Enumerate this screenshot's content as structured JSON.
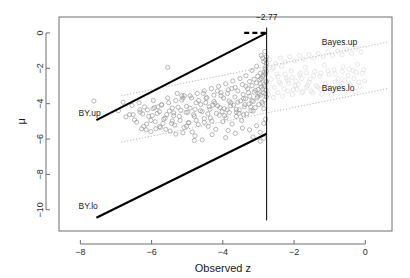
{
  "chart_data": {
    "type": "scatter",
    "title": "",
    "xlabel": "Observed z",
    "ylabel": "μ",
    "xlim": [
      -8.6,
      0.75
    ],
    "ylim": [
      -11.2,
      0.9
    ],
    "xticks": [
      -8,
      -6,
      -4,
      -2,
      0
    ],
    "xticklabels": [
      "−8",
      "−6",
      "−4",
      "−2",
      "0"
    ],
    "yticks": [
      0,
      -2,
      -4,
      -6,
      -8,
      -10
    ],
    "yticklabels": [
      "0",
      "−2",
      "−4",
      "−6",
      "−8",
      "−10"
    ],
    "grid": false,
    "legend_position": "inline-annotations",
    "annotations": [
      {
        "text": "−2.77",
        "x": -2.77,
        "y": 0.72,
        "name": "cutoff-label"
      },
      {
        "text": "BY.up",
        "x": -8.05,
        "y": -4.72,
        "name": "by-up-label"
      },
      {
        "text": "BY.lo",
        "x": -8.05,
        "y": -9.93,
        "name": "by-lo-label"
      },
      {
        "text": "Bayes.up",
        "x": -1.22,
        "y": -0.68,
        "name": "bayes-up-label"
      },
      {
        "text": "Bayes.lo",
        "x": -1.22,
        "y": -3.3,
        "name": "bayes-lo-label"
      }
    ],
    "vline": {
      "x": -2.77,
      "y_from": 0.3,
      "y_to": -10.6,
      "color": "#000000",
      "width": 1
    },
    "series": [
      {
        "name": "BY.up",
        "type": "line",
        "style": "solid",
        "color": "#000000",
        "width": 2.1,
        "points": [
          [
            -7.55,
            -4.93
          ],
          [
            -2.77,
            0.0
          ]
        ]
      },
      {
        "name": "BY.up.flat",
        "type": "line",
        "style": "dashed",
        "color": "#000000",
        "width": 2.4,
        "points": [
          [
            -3.4,
            0.0
          ],
          [
            -2.77,
            0.0
          ]
        ]
      },
      {
        "name": "BY.lo",
        "type": "line",
        "style": "solid",
        "color": "#000000",
        "width": 2.1,
        "points": [
          [
            -7.55,
            -10.45
          ],
          [
            -2.77,
            -5.7
          ]
        ]
      },
      {
        "name": "Bayes.up",
        "type": "line",
        "style": "dotted",
        "color": "#b9b9b9",
        "width": 1,
        "points": [
          [
            -6.85,
            -3.55
          ],
          [
            0.62,
            -0.52
          ]
        ]
      },
      {
        "name": "Bayes.lo",
        "type": "line",
        "style": "dotted",
        "color": "#b9b9b9",
        "width": 1,
        "points": [
          [
            -6.85,
            -6.18
          ],
          [
            0.62,
            -3.15
          ]
        ]
      }
    ],
    "point_style": {
      "marker": "open-circle",
      "radius": 2.1,
      "color_main": "#9a9a9a",
      "color_faint": "#dcdcdc",
      "linewidth": 0.7
    },
    "points_main": [
      [
        -7.62,
        -3.85
      ],
      [
        -6.93,
        -4.4
      ],
      [
        -6.8,
        -3.92
      ],
      [
        -6.62,
        -4.62
      ],
      [
        -6.55,
        -4.1
      ],
      [
        -6.42,
        -5.05
      ],
      [
        -6.33,
        -4.35
      ],
      [
        -6.28,
        -5.42
      ],
      [
        -6.2,
        -4.18
      ],
      [
        -6.14,
        -5.15
      ],
      [
        -6.08,
        -4.72
      ],
      [
        -6.02,
        -5.58
      ],
      [
        -5.96,
        -4.28
      ],
      [
        -5.9,
        -5.02
      ],
      [
        -5.84,
        -4.55
      ],
      [
        -5.78,
        -5.3
      ],
      [
        -5.72,
        -4.05
      ],
      [
        -5.66,
        -4.88
      ],
      [
        -5.6,
        -5.45
      ],
      [
        -5.55,
        -1.95
      ],
      [
        -5.5,
        -4.42
      ],
      [
        -5.44,
        -5.12
      ],
      [
        -5.38,
        -4.68
      ],
      [
        -5.32,
        -5.72
      ],
      [
        -5.26,
        -4.2
      ],
      [
        -5.2,
        -4.95
      ],
      [
        -5.15,
        -3.8
      ],
      [
        -5.09,
        -5.35
      ],
      [
        -5.03,
        -4.5
      ],
      [
        -4.97,
        -5.08
      ],
      [
        -4.92,
        -4.25
      ],
      [
        -4.86,
        -5.6
      ],
      [
        -4.8,
        -4.72
      ],
      [
        -4.75,
        -3.95
      ],
      [
        -4.69,
        -5.18
      ],
      [
        -4.63,
        -4.4
      ],
      [
        -4.58,
        -6.05
      ],
      [
        -4.52,
        -4.85
      ],
      [
        -4.47,
        -3.7
      ],
      [
        -4.41,
        -5.28
      ],
      [
        -4.36,
        -4.32
      ],
      [
        -4.31,
        -4.98
      ],
      [
        -4.25,
        -3.88
      ],
      [
        -4.2,
        -5.45
      ],
      [
        -4.15,
        -4.12
      ],
      [
        -4.1,
        -4.65
      ],
      [
        -4.05,
        -3.55
      ],
      [
        -4.0,
        -5.02
      ],
      [
        -3.96,
        -4.28
      ],
      [
        -3.91,
        -4.8
      ],
      [
        -3.87,
        -3.42
      ],
      [
        -3.82,
        -4.5
      ],
      [
        -3.78,
        -3.95
      ],
      [
        -3.74,
        -5.15
      ],
      [
        -3.7,
        -4.08
      ],
      [
        -3.66,
        -3.62
      ],
      [
        -3.62,
        -4.72
      ],
      [
        -3.58,
        -3.28
      ],
      [
        -3.54,
        -4.35
      ],
      [
        -3.5,
        -3.85
      ],
      [
        -3.47,
        -4.95
      ],
      [
        -3.43,
        -3.48
      ],
      [
        -3.4,
        -4.18
      ],
      [
        -3.36,
        -3.72
      ],
      [
        -3.33,
        -4.58
      ],
      [
        -3.3,
        -3.15
      ],
      [
        -3.27,
        -4.02
      ],
      [
        -3.24,
        -3.58
      ],
      [
        -3.21,
        -4.4
      ],
      [
        -3.18,
        -2.98
      ],
      [
        -3.15,
        -3.88
      ],
      [
        -3.12,
        -3.35
      ],
      [
        -3.09,
        -4.22
      ],
      [
        -3.06,
        -2.82
      ],
      [
        -3.04,
        -3.68
      ],
      [
        -3.01,
        -3.2
      ],
      [
        -2.99,
        -4.05
      ],
      [
        -2.96,
        -2.65
      ],
      [
        -2.94,
        -3.52
      ],
      [
        -2.92,
        -3.05
      ],
      [
        -2.9,
        -3.92
      ],
      [
        -2.88,
        -2.48
      ],
      [
        -2.86,
        -3.38
      ],
      [
        -2.84,
        -2.92
      ],
      [
        -2.82,
        -3.78
      ],
      [
        -2.8,
        -2.32
      ],
      [
        -2.79,
        -3.22
      ],
      [
        -2.78,
        -2.78
      ],
      [
        -2.78,
        -3.62
      ],
      [
        -2.78,
        -2.15
      ],
      [
        -6.48,
        -4.92
      ],
      [
        -6.25,
        -4.58
      ],
      [
        -6.02,
        -4.95
      ],
      [
        -5.82,
        -4.18
      ],
      [
        -5.62,
        -4.82
      ],
      [
        -5.42,
        -4.25
      ],
      [
        -5.22,
        -4.72
      ],
      [
        -5.02,
        -4.15
      ],
      [
        -4.82,
        -4.62
      ],
      [
        -4.62,
        -4.05
      ],
      [
        -4.42,
        -4.58
      ],
      [
        -4.22,
        -3.98
      ],
      [
        -4.02,
        -4.45
      ],
      [
        -3.82,
        -3.85
      ],
      [
        -3.62,
        -4.32
      ],
      [
        -3.42,
        -3.72
      ],
      [
        -3.22,
        -4.18
      ],
      [
        -3.02,
        -3.58
      ],
      [
        -2.88,
        -4.02
      ],
      [
        -2.8,
        -3.45
      ],
      [
        -6.35,
        -3.95
      ],
      [
        -6.15,
        -5.48
      ],
      [
        -5.95,
        -3.82
      ],
      [
        -5.75,
        -5.35
      ],
      [
        -5.55,
        -3.68
      ],
      [
        -5.35,
        -5.22
      ],
      [
        -5.15,
        -3.55
      ],
      [
        -4.95,
        -5.08
      ],
      [
        -4.75,
        -4.95
      ],
      [
        -4.55,
        -3.42
      ],
      [
        -4.35,
        -4.82
      ],
      [
        -4.15,
        -3.28
      ],
      [
        -3.95,
        -4.68
      ],
      [
        -3.75,
        -3.15
      ],
      [
        -3.55,
        -4.55
      ],
      [
        -3.35,
        -3.02
      ],
      [
        -3.15,
        -4.42
      ],
      [
        -2.95,
        -2.88
      ],
      [
        -2.85,
        -4.28
      ],
      [
        -2.79,
        -2.72
      ],
      [
        -4.8,
        -6.08
      ],
      [
        -4.3,
        -5.75
      ],
      [
        -3.85,
        -5.52
      ],
      [
        -3.45,
        -5.38
      ],
      [
        -3.05,
        -5.25
      ],
      [
        -2.85,
        -5.12
      ],
      [
        -2.8,
        -4.88
      ],
      [
        -2.95,
        -5.62
      ],
      [
        -3.25,
        -5.48
      ],
      [
        -3.65,
        -5.68
      ],
      [
        -2.92,
        -1.28
      ],
      [
        -2.85,
        -1.62
      ],
      [
        -2.88,
        -1.42
      ],
      [
        -3.05,
        -1.88
      ],
      [
        -2.82,
        -1.05
      ],
      [
        -3.18,
        -2.12
      ],
      [
        -2.95,
        -2.28
      ],
      [
        -3.35,
        -2.42
      ],
      [
        -2.78,
        -1.72
      ],
      [
        -2.8,
        -1.52
      ],
      [
        -3.52,
        -2.58
      ],
      [
        -3.72,
        -2.72
      ],
      [
        -3.92,
        -2.88
      ],
      [
        -4.12,
        -3.02
      ],
      [
        -4.32,
        -3.15
      ],
      [
        -4.52,
        -3.28
      ],
      [
        -4.72,
        -3.42
      ],
      [
        -4.92,
        -3.55
      ],
      [
        -5.12,
        -3.68
      ],
      [
        -5.32,
        -3.82
      ],
      [
        -5.52,
        -3.95
      ],
      [
        -5.72,
        -4.08
      ],
      [
        -5.92,
        -4.22
      ],
      [
        -6.12,
        -4.35
      ],
      [
        -6.32,
        -4.48
      ],
      [
        -6.52,
        -4.62
      ],
      [
        -6.72,
        -4.75
      ],
      [
        -2.95,
        -6.12
      ],
      [
        -2.85,
        -5.95
      ],
      [
        -3.15,
        -5.88
      ],
      [
        -3.42,
        -4.62
      ],
      [
        -3.62,
        -4.48
      ],
      [
        -3.88,
        -4.35
      ],
      [
        -4.08,
        -4.22
      ],
      [
        -4.28,
        -4.08
      ],
      [
        -4.48,
        -3.95
      ],
      [
        -4.68,
        -3.82
      ],
      [
        -4.88,
        -3.68
      ],
      [
        -5.08,
        -3.55
      ],
      [
        -5.28,
        -3.42
      ],
      [
        -3.28,
        -3.38
      ],
      [
        -3.08,
        -3.25
      ],
      [
        -2.98,
        -3.45
      ],
      [
        -2.88,
        -3.18
      ],
      [
        -2.82,
        -3.02
      ],
      [
        -3.38,
        -4.05
      ],
      [
        -3.18,
        -3.82
      ],
      [
        -3.58,
        -3.92
      ],
      [
        -3.78,
        -4.12
      ],
      [
        -3.98,
        -3.68
      ],
      [
        -4.18,
        -4.55
      ],
      [
        -4.38,
        -4.18
      ],
      [
        -4.58,
        -4.45
      ],
      [
        -4.78,
        -4.32
      ],
      [
        -4.98,
        -4.48
      ],
      [
        -5.18,
        -4.38
      ],
      [
        -5.38,
        -4.52
      ],
      [
        -5.58,
        -4.62
      ],
      [
        -5.78,
        -4.45
      ],
      [
        -5.98,
        -4.68
      ],
      [
        -3.12,
        -2.62
      ],
      [
        -3.02,
        -2.45
      ],
      [
        -2.92,
        -2.58
      ],
      [
        -3.25,
        -2.75
      ],
      [
        -3.45,
        -2.92
      ],
      [
        -3.65,
        -3.08
      ],
      [
        -3.85,
        -3.22
      ],
      [
        -4.05,
        -3.38
      ],
      [
        -4.25,
        -3.52
      ],
      [
        -4.45,
        -3.65
      ],
      [
        -2.86,
        -2.38
      ],
      [
        -2.84,
        -2.22
      ],
      [
        -2.81,
        -2.05
      ],
      [
        -2.79,
        -1.88
      ],
      [
        -2.78,
        -1.35
      ],
      [
        -4.78,
        -5.82
      ],
      [
        -5.12,
        -5.65
      ],
      [
        -5.48,
        -5.55
      ],
      [
        -5.88,
        -5.42
      ],
      [
        -6.22,
        -5.28
      ],
      [
        -3.92,
        -5.92
      ],
      [
        -4.52,
        -5.05
      ],
      [
        -5.02,
        -5.28
      ],
      [
        -5.42,
        -4.98
      ],
      [
        -5.68,
        -5.12
      ]
    ],
    "points_faint": [
      [
        -2.62,
        -2.05
      ],
      [
        -2.48,
        -2.32
      ],
      [
        -2.35,
        -1.88
      ],
      [
        -2.22,
        -2.55
      ],
      [
        -2.08,
        -2.15
      ],
      [
        -1.95,
        -2.72
      ],
      [
        -1.82,
        -2.28
      ],
      [
        -1.68,
        -1.95
      ],
      [
        -1.55,
        -2.62
      ],
      [
        -1.42,
        -2.18
      ],
      [
        -1.28,
        -2.45
      ],
      [
        -1.15,
        -1.82
      ],
      [
        -1.02,
        -2.35
      ],
      [
        -0.88,
        -2.08
      ],
      [
        -0.75,
        -2.58
      ],
      [
        -0.62,
        -1.92
      ],
      [
        -0.48,
        -2.42
      ],
      [
        -0.35,
        -2.12
      ],
      [
        -0.22,
        -1.78
      ],
      [
        -0.08,
        -2.28
      ],
      [
        -2.55,
        -3.08
      ],
      [
        -2.42,
        -2.78
      ],
      [
        -2.28,
        -3.15
      ],
      [
        -2.15,
        -2.85
      ],
      [
        -2.02,
        -3.22
      ],
      [
        -1.88,
        -2.92
      ],
      [
        -1.75,
        -3.32
      ],
      [
        -1.62,
        -2.98
      ],
      [
        -1.48,
        -3.38
      ],
      [
        -1.35,
        -3.05
      ],
      [
        -1.22,
        -3.45
      ],
      [
        -1.08,
        -3.12
      ],
      [
        -0.95,
        -3.52
      ],
      [
        -0.82,
        -3.18
      ],
      [
        -0.68,
        -2.88
      ],
      [
        -0.55,
        -3.25
      ],
      [
        -0.42,
        -2.95
      ],
      [
        -0.28,
        -3.32
      ],
      [
        -0.15,
        -3.02
      ],
      [
        -0.02,
        -2.72
      ],
      [
        -2.68,
        -1.52
      ],
      [
        -2.52,
        -1.72
      ],
      [
        -2.38,
        -1.42
      ],
      [
        -2.25,
        -1.65
      ],
      [
        -2.12,
        -1.35
      ],
      [
        -1.98,
        -1.58
      ],
      [
        -1.85,
        -1.28
      ],
      [
        -1.72,
        -1.48
      ],
      [
        -1.58,
        -1.22
      ],
      [
        -1.45,
        -1.42
      ],
      [
        -1.32,
        -1.15
      ],
      [
        -1.18,
        -1.35
      ],
      [
        -1.05,
        -1.08
      ],
      [
        -0.92,
        -1.28
      ],
      [
        -0.78,
        -1.02
      ],
      [
        -0.65,
        -1.22
      ],
      [
        -0.52,
        -0.95
      ],
      [
        -0.38,
        -1.15
      ],
      [
        -0.25,
        -0.88
      ],
      [
        -0.12,
        -1.08
      ],
      [
        -2.72,
        -3.48
      ],
      [
        -2.58,
        -3.65
      ],
      [
        -2.45,
        -3.38
      ],
      [
        -2.32,
        -3.58
      ],
      [
        -2.18,
        -3.28
      ],
      [
        -2.05,
        -3.48
      ],
      [
        -1.92,
        -3.18
      ],
      [
        -1.78,
        -3.38
      ],
      [
        -1.65,
        -3.08
      ],
      [
        -1.52,
        -3.28
      ],
      [
        -1.38,
        -2.98
      ],
      [
        -1.25,
        -3.18
      ],
      [
        -1.12,
        -2.88
      ],
      [
        -0.98,
        -3.08
      ],
      [
        -0.85,
        -2.78
      ],
      [
        -0.72,
        -2.98
      ],
      [
        -0.58,
        -2.68
      ],
      [
        -0.45,
        -2.88
      ],
      [
        -0.32,
        -2.58
      ],
      [
        -0.18,
        -2.78
      ],
      [
        -2.65,
        -2.62
      ],
      [
        -2.45,
        -2.48
      ],
      [
        -2.25,
        -2.35
      ],
      [
        -2.05,
        -2.52
      ],
      [
        -1.85,
        -2.38
      ],
      [
        -1.65,
        -2.25
      ],
      [
        -1.45,
        -2.42
      ],
      [
        -1.25,
        -2.28
      ],
      [
        -1.05,
        -2.15
      ],
      [
        -0.85,
        -2.32
      ],
      [
        -0.65,
        -2.18
      ],
      [
        -0.45,
        -2.05
      ],
      [
        -0.25,
        -2.22
      ],
      [
        -0.05,
        -2.08
      ],
      [
        -2.58,
        -1.98
      ],
      [
        -2.38,
        -2.88
      ],
      [
        -2.18,
        -2.68
      ],
      [
        -1.98,
        -2.98
      ],
      [
        -1.78,
        -2.58
      ],
      [
        -1.58,
        -2.78
      ]
    ]
  },
  "meta": {
    "frame_color": "#6e6e6e",
    "axis_color": "#6e6e6e",
    "background": "#ffffff"
  }
}
